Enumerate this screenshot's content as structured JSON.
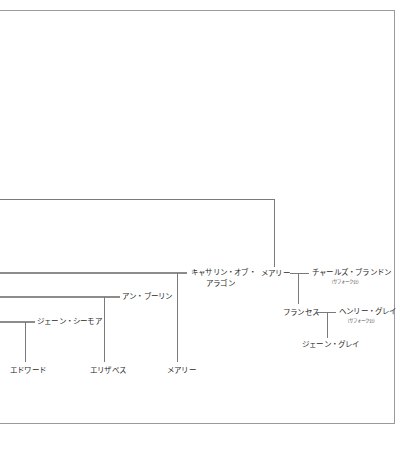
{
  "diagram": {
    "type": "family-tree",
    "spouses": {
      "catherine": {
        "name_line1": "キャサリン・オブ・",
        "name_line2": "アラゴン"
      },
      "anne": {
        "name": "アン・ブーリン"
      },
      "jane_seymour": {
        "name": "ジェーン・シーモア"
      },
      "charles": {
        "name": "チャールズ・ブランドン",
        "title": "（サフォーク公）"
      },
      "henry_grey": {
        "name": "ヘンリー・グレイ",
        "title": "（サフォーク公）"
      }
    },
    "people": {
      "mary_sister": {
        "name": "メアリー"
      },
      "frances": {
        "name": "フランセス"
      },
      "jane_grey": {
        "name": "ジェーン・グレイ"
      }
    },
    "children": {
      "edward": {
        "name": "エドワード"
      },
      "elizabeth": {
        "name": "エリザベス"
      },
      "mary_daughter": {
        "name": "メアリー"
      }
    },
    "colors": {
      "line": "#7a7a7a",
      "frame": "#9a9a9a",
      "text": "#2a2a2a",
      "background": "#ffffff"
    }
  }
}
